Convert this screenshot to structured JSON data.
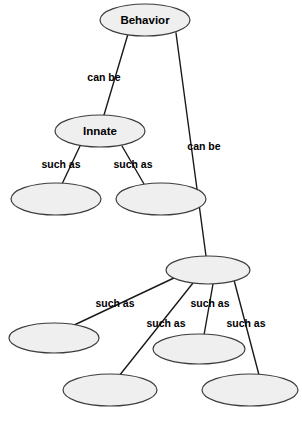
{
  "diagram": {
    "type": "concept-map",
    "background_color": "#ffffff",
    "node_fill_color": "#efefef",
    "node_stroke_color": "#3c3c3c",
    "edge_color": "#1a1a1a",
    "text_color": "#000000",
    "nodes": [
      {
        "id": "behavior",
        "label": "Behavior",
        "cx": 145,
        "cy": 20,
        "rx": 45,
        "ry": 16
      },
      {
        "id": "innate",
        "label": "Innate",
        "cx": 100,
        "cy": 131,
        "rx": 45,
        "ry": 16
      },
      {
        "id": "innate-child-1",
        "label": "",
        "cx": 56,
        "cy": 199,
        "rx": 45,
        "ry": 16
      },
      {
        "id": "innate-child-2",
        "label": "",
        "cx": 161,
        "cy": 199,
        "rx": 45,
        "ry": 16
      },
      {
        "id": "learned",
        "label": "",
        "cx": 208,
        "cy": 270,
        "rx": 42,
        "ry": 14
      },
      {
        "id": "learned-child-1",
        "label": "",
        "cx": 54,
        "cy": 338,
        "rx": 45,
        "ry": 15
      },
      {
        "id": "learned-child-2",
        "label": "",
        "cx": 110,
        "cy": 390,
        "rx": 47,
        "ry": 16
      },
      {
        "id": "learned-child-3",
        "label": "",
        "cx": 199,
        "cy": 349,
        "rx": 46,
        "ry": 15
      },
      {
        "id": "learned-child-4",
        "label": "",
        "cx": 250,
        "cy": 390,
        "rx": 48,
        "ry": 16
      }
    ],
    "edges": [
      {
        "id": "behavior-innate",
        "from": "behavior",
        "to": "innate",
        "x1": 128,
        "y1": 34,
        "x2": 104,
        "y2": 115
      },
      {
        "id": "behavior-learned",
        "from": "behavior",
        "to": "learned",
        "x1": 176,
        "y1": 33,
        "x2": 206,
        "y2": 256
      },
      {
        "id": "innate-child1",
        "from": "innate",
        "to": "innate-child-1",
        "x1": 80,
        "y1": 146,
        "x2": 62,
        "y2": 184
      },
      {
        "id": "innate-child2",
        "from": "innate",
        "to": "innate-child-2",
        "x1": 122,
        "y1": 146,
        "x2": 144,
        "y2": 184
      },
      {
        "id": "learned-child1",
        "from": "learned",
        "to": "learned-child-1",
        "x1": 176,
        "y1": 277,
        "x2": 70,
        "y2": 327
      },
      {
        "id": "learned-child2",
        "from": "learned",
        "to": "learned-child-2",
        "x1": 193,
        "y1": 283,
        "x2": 119,
        "y2": 376
      },
      {
        "id": "learned-child3",
        "from": "learned",
        "to": "learned-child-3",
        "x1": 213,
        "y1": 284,
        "x2": 204,
        "y2": 335
      },
      {
        "id": "learned-child4",
        "from": "learned",
        "to": "learned-child-4",
        "x1": 234,
        "y1": 280,
        "x2": 259,
        "y2": 375
      }
    ],
    "edge_labels": [
      {
        "id": "label-can-be-1",
        "text": "can be",
        "x": 104,
        "y": 78
      },
      {
        "id": "label-can-be-2",
        "text": "can be",
        "x": 204,
        "y": 147
      },
      {
        "id": "label-such-as-1",
        "text": "such as",
        "x": 61,
        "y": 165
      },
      {
        "id": "label-such-as-2",
        "text": "such as",
        "x": 133,
        "y": 165
      },
      {
        "id": "label-such-as-3",
        "text": "such as",
        "x": 115,
        "y": 304
      },
      {
        "id": "label-such-as-4",
        "text": "such as",
        "x": 166,
        "y": 324
      },
      {
        "id": "label-such-as-5",
        "text": "such as",
        "x": 210,
        "y": 304
      },
      {
        "id": "label-such-as-6",
        "text": "such as",
        "x": 246,
        "y": 324
      }
    ]
  }
}
